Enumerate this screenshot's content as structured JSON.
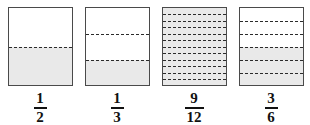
{
  "figure": {
    "background_color": "#ffffff",
    "shade_color": "#e9e9e9",
    "outline_color": "#4a4a4a",
    "dash_color": "#2b2b2b",
    "text_color": "#111111"
  },
  "models": [
    {
      "id": "bar-one-half",
      "label": "1/2",
      "numerator": "1",
      "denominator": "2",
      "total_parts": 2,
      "shaded_parts": 1,
      "divider_count": 1,
      "shaded_from": "bottom",
      "fully_shaded": false
    },
    {
      "id": "bar-one-third",
      "label": "1/3",
      "numerator": "1",
      "denominator": "3",
      "total_parts": 3,
      "shaded_parts": 1,
      "divider_count": 2,
      "shaded_from": "bottom",
      "fully_shaded": false
    },
    {
      "id": "bar-nine-twelfths",
      "label": "9/12",
      "numerator": "9",
      "denominator": "12",
      "total_parts": 12,
      "shaded_parts": 12,
      "divider_count": 11,
      "shaded_from": "bottom",
      "fully_shaded": true
    },
    {
      "id": "bar-three-sixths",
      "label": "3/6",
      "numerator": "3",
      "denominator": "6",
      "total_parts": 6,
      "shaded_parts": 3,
      "divider_count": 5,
      "shaded_from": "bottom",
      "fully_shaded": false
    }
  ]
}
